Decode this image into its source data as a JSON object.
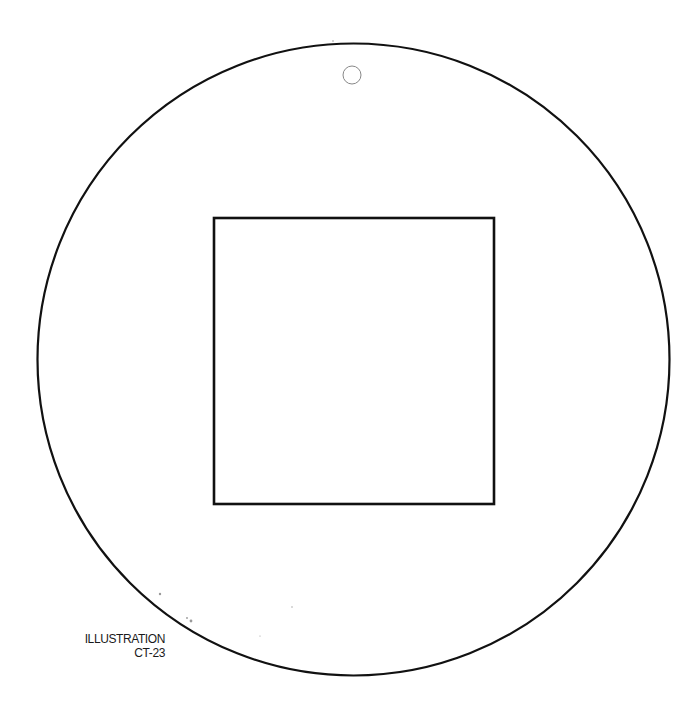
{
  "caption": {
    "line1": "ILLUSTRATION",
    "line2": "CT-23"
  },
  "figure": {
    "outer_circle": {
      "cx": 353.5,
      "cy": 359.5,
      "r": 316,
      "stroke": "#111111",
      "stroke_width": 2.2
    },
    "inner_square": {
      "x": 214,
      "y": 218,
      "width": 280,
      "height": 286,
      "stroke": "#111111",
      "stroke_width": 2.6
    },
    "hole": {
      "cx": 352,
      "cy": 75,
      "r": 9,
      "stroke": "#888888",
      "stroke_width": 1
    }
  }
}
